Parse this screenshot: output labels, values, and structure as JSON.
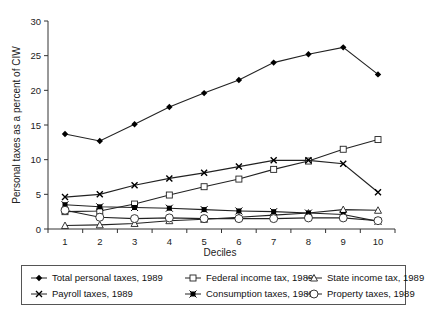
{
  "chart_data": {
    "type": "line",
    "title": "",
    "xlabel": "Deciles",
    "ylabel": "Personal taxes as a percent of CIW",
    "x": [
      1,
      2,
      3,
      4,
      5,
      6,
      7,
      8,
      9,
      10
    ],
    "xticks": [
      "1",
      "2",
      "3",
      "4",
      "5",
      "6",
      "7",
      "8",
      "9",
      "10"
    ],
    "yticks": [
      "0",
      "5",
      "10",
      "15",
      "20",
      "25",
      "30"
    ],
    "ylim": [
      0,
      30
    ],
    "grid": false,
    "legend_position": "bottom",
    "series": [
      {
        "name": "Total personal taxes, 1989",
        "marker": "diamond-filled",
        "values": [
          13.7,
          12.7,
          15.1,
          17.6,
          19.6,
          21.5,
          24.0,
          25.2,
          26.2,
          22.3
        ]
      },
      {
        "name": "Federal income tax, 1989",
        "marker": "square-open",
        "values": [
          2.5,
          2.6,
          3.6,
          4.9,
          6.1,
          7.2,
          8.6,
          9.8,
          11.5,
          12.9
        ]
      },
      {
        "name": "State income tax, 1989",
        "marker": "triangle-open",
        "values": [
          0.5,
          0.6,
          0.8,
          1.2,
          1.4,
          1.7,
          2.0,
          2.3,
          2.8,
          2.7
        ]
      },
      {
        "name": "Payroll taxes, 1989",
        "marker": "x",
        "values": [
          4.6,
          5.0,
          6.3,
          7.3,
          8.1,
          9.0,
          9.9,
          9.9,
          9.4,
          5.3
        ]
      },
      {
        "name": "Consumption taxes, 1989",
        "marker": "star-filled",
        "values": [
          3.5,
          3.2,
          3.1,
          3.0,
          2.8,
          2.6,
          2.5,
          2.3,
          2.1,
          1.1
        ]
      },
      {
        "name": "Property taxes, 1989",
        "marker": "circle-open",
        "values": [
          2.7,
          1.7,
          1.5,
          1.6,
          1.5,
          1.5,
          1.5,
          1.6,
          1.6,
          1.2
        ]
      }
    ]
  }
}
